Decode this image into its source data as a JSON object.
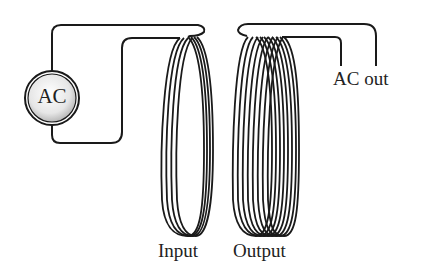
{
  "diagram": {
    "type": "transformer",
    "source": {
      "label": "AC",
      "icon": "ac-source-icon"
    },
    "output_terminal": {
      "label": "AC out"
    },
    "coils": [
      {
        "label": "Input",
        "turns": 4
      },
      {
        "label": "Output",
        "turns": 8
      }
    ],
    "colors": {
      "wire": "#1a1a1a",
      "background": "#ffffff",
      "source_fill": "#e8e8e8"
    }
  }
}
